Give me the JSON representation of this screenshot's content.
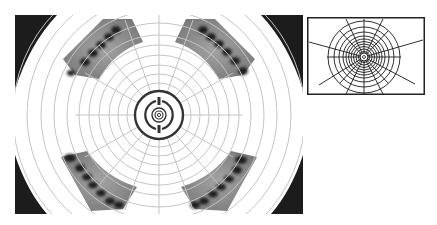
{
  "figure": {
    "main_panel": {
      "label": "Polar grid photograph",
      "sectors": [
        {
          "position": "upper-left",
          "spot_count": 6
        },
        {
          "position": "upper-right",
          "spot_count": 6
        },
        {
          "position": "lower-left",
          "spot_count": 7
        },
        {
          "position": "lower-right",
          "spot_count": 7
        }
      ],
      "center_marker": "concentric rings with split outer ring"
    },
    "inset_panel": {
      "label": "Schematic radial grid"
    },
    "colors": {
      "background": "#ffffff",
      "grid_line": "#c8c8c8",
      "ring_dark": "#333333",
      "sector_fill": "#8a8a8a",
      "spot": "#1e1e1e",
      "corner": "#1a1a1a"
    }
  }
}
